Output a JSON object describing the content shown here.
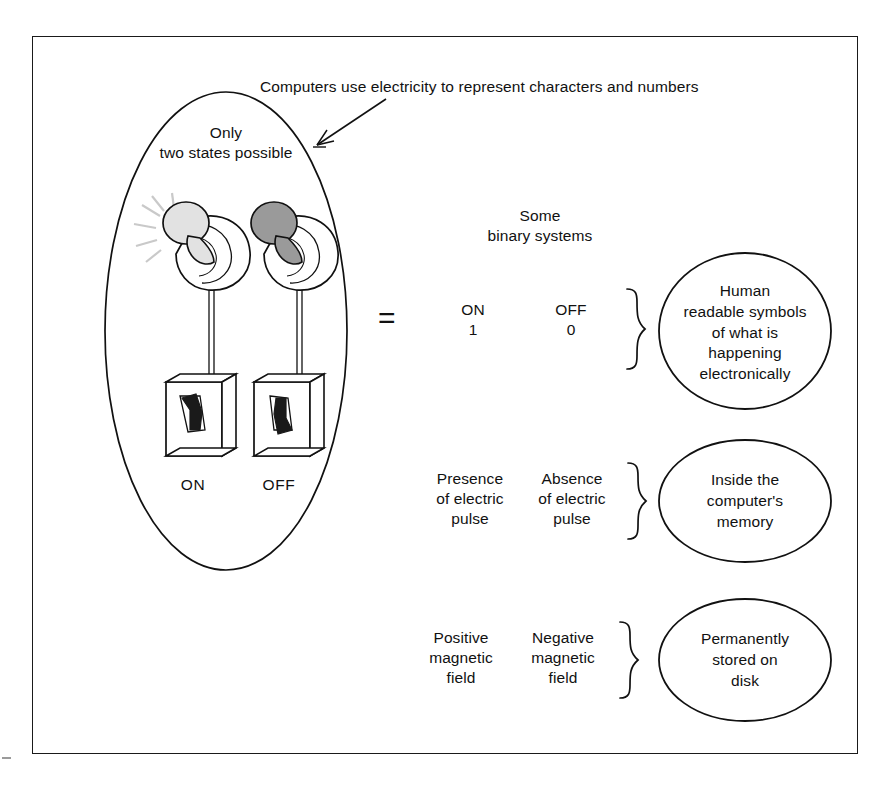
{
  "diagram": {
    "title": "Computers use electricity to represent characters and numbers",
    "left_group": {
      "caption": "Only\ntwo states possible",
      "bulbs": [
        {
          "label": "ON",
          "state": "lit",
          "bulb_color": "#e2e2e2"
        },
        {
          "label": "OFF",
          "state": "dark",
          "bulb_color": "#9a9a9a"
        }
      ]
    },
    "equals_symbol": "=",
    "middle": {
      "header": "Some\nbinary systems",
      "rows": [
        {
          "on_text": "ON\n1",
          "off_text": "OFF\n0",
          "result": "Human\nreadable symbols\nof what is\nhappening\nelectronically"
        },
        {
          "on_text": "Presence\nof electric\npulse",
          "off_text": "Absence\nof electric\npulse",
          "result": "Inside the\ncomputer's\nmemory"
        },
        {
          "on_text": "Positive\nmagnetic\nfield",
          "off_text": "Negative\nmagnetic\nfield",
          "result": "Permanently\nstored on\ndisk"
        }
      ]
    },
    "colors": {
      "ink": "#111111",
      "frame": "#1a1a1a",
      "bulb_lit": "#e2e2e2",
      "bulb_dark": "#9a9a9a",
      "switch_lever": "#1a1a1a"
    }
  }
}
